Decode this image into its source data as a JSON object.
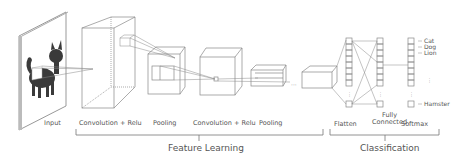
{
  "diagram": {
    "layers": [
      {
        "id": "input",
        "label": "Input"
      },
      {
        "id": "conv1",
        "label": "Convolution + Relu"
      },
      {
        "id": "pool1",
        "label": "Pooling"
      },
      {
        "id": "conv2",
        "label": "Convolution + Relu"
      },
      {
        "id": "pool2",
        "label": "Pooling"
      },
      {
        "id": "flatten",
        "label": "Flatten"
      },
      {
        "id": "fc",
        "label": "Fully\nConnected",
        "label_line1": "Fully",
        "label_line2": "Connected"
      },
      {
        "id": "softmax",
        "label": "Softmax"
      }
    ],
    "groups": [
      {
        "id": "feature-learning",
        "label": "Feature Learning"
      },
      {
        "id": "classification",
        "label": "Classification"
      }
    ],
    "classes": [
      "Cat",
      "Dog",
      "Lion",
      "Hamster"
    ],
    "colors": {
      "line": "#888888",
      "text": "#555555",
      "cat": "#3a3a3a",
      "frame": "#999999"
    }
  }
}
